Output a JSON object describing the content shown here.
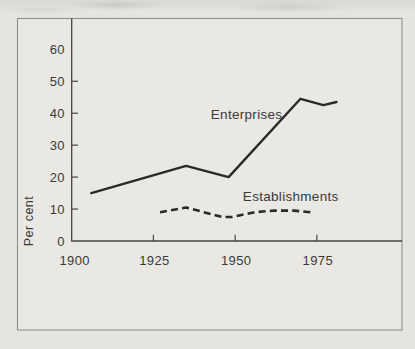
{
  "chart_data": {
    "type": "line",
    "title": "",
    "xlabel": "",
    "ylabel": "Per cent",
    "x_tick_labels": [
      1900,
      1925,
      1950,
      1975
    ],
    "x_tick_marks": [
      1925,
      1950,
      1975
    ],
    "y_tick_labels": [
      0,
      10,
      20,
      30,
      40,
      50,
      60
    ],
    "y_tick_marks": [
      10,
      20,
      30,
      40,
      50
    ],
    "xlim": [
      1900,
      2000
    ],
    "ylim": [
      0,
      70
    ],
    "grid": false,
    "legend_position": "inline-annotations",
    "series": [
      {
        "name": "Enterprises",
        "line_style": "solid",
        "points": [
          [
            1906,
            15
          ],
          [
            1935,
            23.5
          ],
          [
            1948,
            20
          ],
          [
            1970,
            44.5
          ],
          [
            1977,
            42.5
          ],
          [
            1981,
            43.5
          ]
        ]
      },
      {
        "name": "Establishments",
        "line_style": "dashed",
        "points": [
          [
            1927,
            9
          ],
          [
            1935,
            10.5
          ],
          [
            1946,
            7.5
          ],
          [
            1949,
            7.5
          ],
          [
            1956,
            9
          ],
          [
            1962,
            9.5
          ],
          [
            1968,
            9.5
          ],
          [
            1973,
            9
          ]
        ]
      }
    ],
    "annotations": [
      {
        "text": "Enterprises",
        "year": 1953.5,
        "value": 39.5
      },
      {
        "text": "Establishments",
        "year": 1967,
        "value": 14
      }
    ]
  },
  "colors": {
    "paper": "#e6e4df",
    "panel": "#eae8e3",
    "border": "#8f8e86",
    "axis": "#45443e",
    "ink": "#2a2a27",
    "text": "#3b3a35"
  }
}
